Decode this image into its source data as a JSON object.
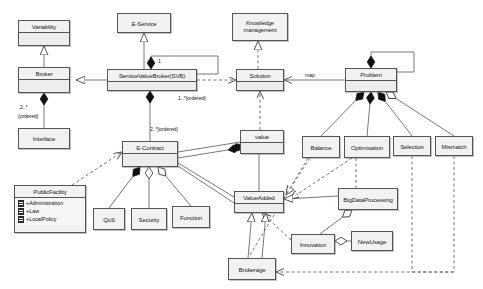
{
  "diagram": {
    "type": "uml-class-diagram",
    "background": "#ffffff",
    "node_fill": "#f2f2f2",
    "node_stroke": "#555555"
  },
  "classes": [
    {
      "id": "variability",
      "name": "Variability",
      "x": 18,
      "y": 20,
      "w": 52,
      "h": 26,
      "compartments": 2
    },
    {
      "id": "broker",
      "name": "Broker",
      "x": 18,
      "y": 67,
      "w": 52,
      "h": 26,
      "compartments": 2
    },
    {
      "id": "interface",
      "name": "Interface",
      "x": 18,
      "y": 128,
      "w": 52,
      "h": 21,
      "compartments": 1
    },
    {
      "id": "publicfacility",
      "name": "PublicFacility",
      "x": 14,
      "y": 185,
      "w": 72,
      "h": 48,
      "compartments": 2,
      "attributes": [
        "+Administration",
        "+Law",
        "+LocalPolicy"
      ]
    },
    {
      "id": "eservice",
      "name": "E-Service",
      "x": 117,
      "y": 13,
      "w": 54,
      "h": 20,
      "compartments": 1
    },
    {
      "id": "svb",
      "name": "ServiceValueBroker(SVB)",
      "x": 107,
      "y": 69,
      "w": 90,
      "h": 22,
      "compartments": 2
    },
    {
      "id": "econtract",
      "name": "E-Contract",
      "x": 122,
      "y": 141,
      "w": 56,
      "h": 26,
      "compartments": 2
    },
    {
      "id": "qos",
      "name": "QoS",
      "x": 93,
      "y": 208,
      "w": 32,
      "h": 22,
      "compartments": 1
    },
    {
      "id": "security",
      "name": "Security",
      "x": 131,
      "y": 208,
      "w": 36,
      "h": 22,
      "compartments": 1
    },
    {
      "id": "function",
      "name": "Function",
      "x": 172,
      "y": 206,
      "w": 38,
      "h": 22,
      "compartments": 1
    },
    {
      "id": "knowledge",
      "name": "Knowledge management",
      "x": 232,
      "y": 13,
      "w": 56,
      "h": 28,
      "compartments": 1,
      "twoline": true
    },
    {
      "id": "solution",
      "name": "Solution",
      "x": 236,
      "y": 69,
      "w": 48,
      "h": 22,
      "compartments": 2
    },
    {
      "id": "problem",
      "name": "Problem",
      "x": 345,
      "y": 68,
      "w": 52,
      "h": 24,
      "compartments": 2
    },
    {
      "id": "value",
      "name": "value",
      "x": 240,
      "y": 130,
      "w": 44,
      "h": 24,
      "compartments": 2
    },
    {
      "id": "balance",
      "name": "Balance",
      "x": 302,
      "y": 136,
      "w": 38,
      "h": 22,
      "compartments": 1
    },
    {
      "id": "optimisation",
      "name": "Optimisation",
      "x": 344,
      "y": 136,
      "w": 46,
      "h": 22,
      "compartments": 1
    },
    {
      "id": "selection",
      "name": "Selection",
      "x": 393,
      "y": 136,
      "w": 38,
      "h": 20,
      "compartments": 1
    },
    {
      "id": "mismatch",
      "name": "Mismatch",
      "x": 435,
      "y": 136,
      "w": 38,
      "h": 20,
      "compartments": 1
    },
    {
      "id": "valueadded",
      "name": "ValueAdded",
      "x": 234,
      "y": 191,
      "w": 50,
      "h": 22,
      "compartments": 2
    },
    {
      "id": "bigdata",
      "name": "BigDataProcessing",
      "x": 338,
      "y": 188,
      "w": 60,
      "h": 22,
      "compartments": 1
    },
    {
      "id": "innovation",
      "name": "Innovation",
      "x": 291,
      "y": 234,
      "w": 44,
      "h": 20,
      "compartments": 1
    },
    {
      "id": "newusage",
      "name": "NewUsage",
      "x": 351,
      "y": 231,
      "w": 42,
      "h": 20,
      "compartments": 1
    },
    {
      "id": "brokerage",
      "name": "Brokerage",
      "x": 228,
      "y": 258,
      "w": 48,
      "h": 22,
      "compartments": 1
    }
  ],
  "edge_labels": [
    {
      "id": "broker-interface-mult",
      "text": "2..*",
      "x": 20,
      "y": 104
    },
    {
      "id": "broker-interface-order",
      "text": "{ordered}",
      "x": 18,
      "y": 113
    },
    {
      "id": "svb-self-mult",
      "text": "1",
      "x": 158,
      "y": 58
    },
    {
      "id": "svb-ordered",
      "text": "1..*{ordered}",
      "x": 178,
      "y": 95
    },
    {
      "id": "econtract-ordered",
      "text": "2..*{ordered}",
      "x": 150,
      "y": 126
    },
    {
      "id": "solution-problem-map",
      "text": "map",
      "x": 305,
      "y": 72
    }
  ]
}
